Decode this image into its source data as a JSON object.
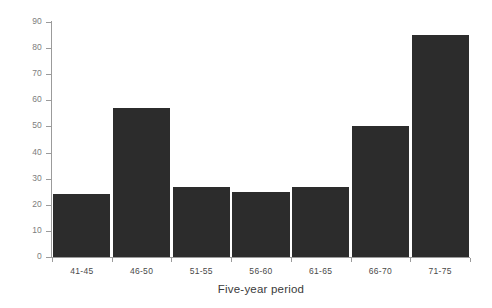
{
  "chart_data": {
    "type": "bar",
    "title": "",
    "xlabel": "Five-year period",
    "ylabel": "Number of birds",
    "categories": [
      "41-45",
      "46-50",
      "51-55",
      "56-60",
      "61-65",
      "66-70",
      "71-75"
    ],
    "values": [
      24,
      57,
      27,
      25,
      27,
      50,
      85
    ],
    "ylim": [
      0,
      90
    ],
    "yticks": [
      0,
      10,
      20,
      30,
      40,
      50,
      60,
      70,
      80,
      90
    ],
    "ytick_labels": [
      "0",
      "10",
      "20",
      "30",
      "40",
      "50",
      "60",
      "70",
      "80",
      "90"
    ],
    "grid": false,
    "legend": false,
    "bar_color": "#2c2c2c",
    "axis_color": "#9b9b9b",
    "tick_label_color": "#7d7d7d",
    "background": "#ffffff"
  }
}
